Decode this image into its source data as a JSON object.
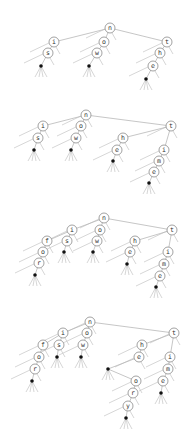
{
  "diagram": {
    "type": "trie-insertion-sequence",
    "node_radius": 5,
    "colors": {
      "edge": "#b8b8b8",
      "node_stroke": "#8a8a8a",
      "terminal": "#111111",
      "text": "#333333"
    },
    "trees": [
      {
        "id": "tree-1",
        "words": [
          "is",
          "ow",
          "the"
        ],
        "nodes": [
          {
            "id": "n",
            "label": "n",
            "x": 110,
            "y": 28
          },
          {
            "id": "i",
            "label": "i",
            "x": 54,
            "y": 42,
            "parent": "n"
          },
          {
            "id": "o",
            "label": "o",
            "x": 104,
            "y": 42,
            "parent": "n"
          },
          {
            "id": "t",
            "label": "t",
            "x": 167,
            "y": 42,
            "parent": "n"
          },
          {
            "id": "s",
            "label": "s",
            "x": 48,
            "y": 53,
            "parent": "i"
          },
          {
            "id": "w",
            "label": "w",
            "x": 97,
            "y": 53,
            "parent": "o"
          },
          {
            "id": "h",
            "label": "h",
            "x": 160,
            "y": 53,
            "parent": "t"
          },
          {
            "id": "d1",
            "terminal": true,
            "x": 41,
            "y": 66,
            "parent": "s"
          },
          {
            "id": "d2",
            "terminal": true,
            "x": 89,
            "y": 66,
            "parent": "w"
          },
          {
            "id": "e",
            "label": "e",
            "x": 153,
            "y": 66,
            "parent": "h"
          },
          {
            "id": "d3",
            "terminal": true,
            "x": 146,
            "y": 79,
            "parent": "e"
          }
        ]
      },
      {
        "id": "tree-2",
        "words": [
          "is",
          "ow",
          "the",
          "time"
        ],
        "nodes": [
          {
            "id": "n",
            "label": "n",
            "x": 86,
            "y": 115
          },
          {
            "id": "i",
            "label": "i",
            "x": 43,
            "y": 126,
            "parent": "n"
          },
          {
            "id": "o",
            "label": "o",
            "x": 81,
            "y": 126,
            "parent": "n"
          },
          {
            "id": "t",
            "label": "t",
            "x": 171,
            "y": 126,
            "parent": "n"
          },
          {
            "id": "s",
            "label": "s",
            "x": 38,
            "y": 138,
            "parent": "i"
          },
          {
            "id": "w",
            "label": "w",
            "x": 76,
            "y": 138,
            "parent": "o"
          },
          {
            "id": "h",
            "label": "h",
            "x": 123,
            "y": 138,
            "parent": "t"
          },
          {
            "id": "d1",
            "terminal": true,
            "x": 34,
            "y": 150,
            "parent": "s"
          },
          {
            "id": "d2",
            "terminal": true,
            "x": 71,
            "y": 150,
            "parent": "w"
          },
          {
            "id": "e",
            "label": "e",
            "x": 117,
            "y": 150,
            "parent": "h"
          },
          {
            "id": "i2",
            "label": "i",
            "x": 164,
            "y": 150,
            "parent": "t"
          },
          {
            "id": "d3",
            "terminal": true,
            "x": 113,
            "y": 161,
            "parent": "e"
          },
          {
            "id": "m",
            "label": "m",
            "x": 159,
            "y": 161,
            "parent": "i2"
          },
          {
            "id": "e2",
            "label": "e",
            "x": 154,
            "y": 172,
            "parent": "m"
          },
          {
            "id": "d4",
            "terminal": true,
            "x": 149,
            "y": 183,
            "parent": "e2"
          }
        ]
      },
      {
        "id": "tree-3",
        "words": [
          "for",
          "is",
          "ow",
          "the",
          "time"
        ],
        "nodes": [
          {
            "id": "n",
            "label": "n",
            "x": 104,
            "y": 218
          },
          {
            "id": "i",
            "label": "i",
            "x": 72,
            "y": 230,
            "parent": "n"
          },
          {
            "id": "o",
            "label": "o",
            "x": 100,
            "y": 230,
            "parent": "n"
          },
          {
            "id": "t",
            "label": "t",
            "x": 172,
            "y": 230,
            "parent": "n"
          },
          {
            "id": "f",
            "label": "f",
            "x": 47,
            "y": 241,
            "parent": "i"
          },
          {
            "id": "s",
            "label": "s",
            "x": 67,
            "y": 241,
            "parent": "i"
          },
          {
            "id": "w",
            "label": "w",
            "x": 97,
            "y": 241,
            "parent": "o"
          },
          {
            "id": "h",
            "label": "h",
            "x": 135,
            "y": 241,
            "parent": "t"
          },
          {
            "id": "o2",
            "label": "o",
            "x": 43,
            "y": 252,
            "parent": "f"
          },
          {
            "id": "d1",
            "terminal": true,
            "x": 64,
            "y": 252,
            "parent": "s"
          },
          {
            "id": "d2",
            "terminal": true,
            "x": 93,
            "y": 252,
            "parent": "w"
          },
          {
            "id": "e",
            "label": "e",
            "x": 130,
            "y": 252,
            "parent": "h"
          },
          {
            "id": "i2",
            "label": "i",
            "x": 168,
            "y": 252,
            "parent": "t"
          },
          {
            "id": "r",
            "label": "r",
            "x": 39,
            "y": 263,
            "parent": "o2"
          },
          {
            "id": "d3",
            "terminal": true,
            "x": 127,
            "y": 264,
            "parent": "e"
          },
          {
            "id": "m",
            "label": "m",
            "x": 164,
            "y": 264,
            "parent": "i2"
          },
          {
            "id": "d4",
            "terminal": true,
            "x": 35,
            "y": 275,
            "parent": "r"
          },
          {
            "id": "e2",
            "label": "e",
            "x": 160,
            "y": 276,
            "parent": "m"
          },
          {
            "id": "d5",
            "terminal": true,
            "x": 156,
            "y": 287,
            "parent": "e2"
          }
        ]
      },
      {
        "id": "tree-4",
        "words": [
          "for",
          "is",
          "ow",
          "the",
          "theory",
          "time"
        ],
        "nodes": [
          {
            "id": "n",
            "label": "n",
            "x": 90,
            "y": 322
          },
          {
            "id": "i",
            "label": "i",
            "x": 63,
            "y": 333,
            "parent": "n"
          },
          {
            "id": "o",
            "label": "o",
            "x": 87,
            "y": 333,
            "parent": "n"
          },
          {
            "id": "t",
            "label": "t",
            "x": 174,
            "y": 333,
            "parent": "n"
          },
          {
            "id": "f",
            "label": "f",
            "x": 43,
            "y": 345,
            "parent": "i"
          },
          {
            "id": "s",
            "label": "s",
            "x": 59,
            "y": 345,
            "parent": "i"
          },
          {
            "id": "w",
            "label": "w",
            "x": 83,
            "y": 345,
            "parent": "o"
          },
          {
            "id": "h",
            "label": "h",
            "x": 142,
            "y": 345,
            "parent": "t"
          },
          {
            "id": "o2",
            "label": "o",
            "x": 39,
            "y": 357,
            "parent": "f"
          },
          {
            "id": "d1",
            "terminal": true,
            "x": 57,
            "y": 357,
            "parent": "s"
          },
          {
            "id": "d2",
            "terminal": true,
            "x": 81,
            "y": 357,
            "parent": "w"
          },
          {
            "id": "e",
            "label": "e",
            "x": 139,
            "y": 357,
            "parent": "h"
          },
          {
            "id": "i2",
            "label": "i",
            "x": 170,
            "y": 357,
            "parent": "t"
          },
          {
            "id": "r",
            "label": "r",
            "x": 35,
            "y": 369,
            "parent": "o2"
          },
          {
            "id": "d3",
            "terminal": true,
            "x": 108,
            "y": 369,
            "parent": "e"
          },
          {
            "id": "m",
            "label": "m",
            "x": 168,
            "y": 369,
            "parent": "i2"
          },
          {
            "id": "d4",
            "terminal": true,
            "x": 32,
            "y": 381,
            "parent": "r"
          },
          {
            "id": "o3",
            "label": "o",
            "x": 136,
            "y": 381,
            "parent": "d3"
          },
          {
            "id": "e2",
            "label": "e",
            "x": 163,
            "y": 381,
            "parent": "m"
          },
          {
            "id": "r2",
            "label": "r",
            "x": 133,
            "y": 393,
            "parent": "o3"
          },
          {
            "id": "d5",
            "terminal": true,
            "x": 161,
            "y": 393,
            "parent": "e2"
          },
          {
            "id": "y",
            "label": "y",
            "x": 128,
            "y": 406,
            "parent": "r2"
          },
          {
            "id": "d6",
            "terminal": true,
            "x": 126,
            "y": 418,
            "parent": "y"
          }
        ]
      }
    ]
  }
}
